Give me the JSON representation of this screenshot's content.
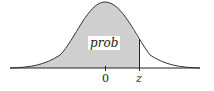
{
  "figure": {
    "type": "standard normal distribution with shaded left tail area",
    "shaded_region_label": "prob",
    "axis_labels": [
      "0",
      "z"
    ],
    "colors": {
      "fill": "#cfcfcf",
      "curve": "#333333",
      "axis": "#222222",
      "label_bg": "#ffffff"
    }
  }
}
